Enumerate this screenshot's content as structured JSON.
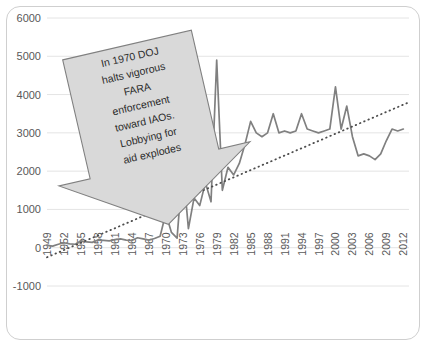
{
  "chart_data": {
    "type": "line",
    "title": "",
    "xlabel": "",
    "ylabel": "",
    "ylim": [
      -1000,
      6000
    ],
    "ytick_values": [
      -1000,
      0,
      1000,
      2000,
      3000,
      4000,
      5000,
      6000
    ],
    "ytick_labels": [
      "-1000",
      "0",
      "1000",
      "2000",
      "3000",
      "4000",
      "5000",
      "6000"
    ],
    "xtick_labels": [
      "1949",
      "1952",
      "1955",
      "1958",
      "1961",
      "1964",
      "1967",
      "1970",
      "1973",
      "1976",
      "1979",
      "1982",
      "1985",
      "1988",
      "1991",
      "1994",
      "1997",
      "2000",
      "2003",
      "2006",
      "2009",
      "2012"
    ],
    "xlim": [
      1949,
      2013
    ],
    "grid": "horizontal",
    "legend": "none",
    "series": [
      {
        "name": "FARA registrations",
        "style": "solid",
        "color": "#808080",
        "x": [
          1949,
          1950,
          1951,
          1952,
          1953,
          1954,
          1955,
          1956,
          1957,
          1958,
          1959,
          1960,
          1961,
          1962,
          1963,
          1964,
          1965,
          1966,
          1967,
          1968,
          1969,
          1970,
          1971,
          1972,
          1973,
          1974,
          1975,
          1976,
          1977,
          1978,
          1979,
          1980,
          1981,
          1982,
          1983,
          1984,
          1985,
          1986,
          1987,
          1988,
          1989,
          1990,
          1991,
          1992,
          1993,
          1994,
          1995,
          1996,
          1997,
          1998,
          1999,
          2000,
          2001,
          2002,
          2003,
          2004,
          2005,
          2006,
          2007,
          2008,
          2009,
          2010,
          2011,
          2012
        ],
        "values": [
          60,
          40,
          90,
          130,
          100,
          90,
          180,
          150,
          140,
          200,
          190,
          180,
          210,
          230,
          200,
          190,
          260,
          230,
          200,
          240,
          300,
          900,
          400,
          250,
          2150,
          500,
          1300,
          1100,
          1700,
          1200,
          4900,
          1500,
          2100,
          1900,
          2200,
          2700,
          3300,
          3000,
          2900,
          3000,
          3500,
          3000,
          3050,
          3000,
          3050,
          3500,
          3100,
          3050,
          3000,
          3050,
          3100,
          4200,
          3100,
          3700,
          2900,
          2400,
          2450,
          2400,
          2300,
          2450,
          2800,
          3100,
          3050,
          3100
        ]
      },
      {
        "name": "Linear trend",
        "style": "dotted",
        "color": "#4d4d4d",
        "x": [
          1949,
          2013
        ],
        "values": [
          -250,
          3800
        ]
      }
    ],
    "annotations": [
      {
        "name": "doj-fara-callout",
        "shape": "down-arrow-callout",
        "rotation_deg": -13,
        "fill": "#d9d9d9",
        "stroke": "#808080",
        "points_to_year": 1973,
        "lines": [
          "In 1970 DOJ",
          "halts vigorous",
          "FARA",
          "enforcement",
          "toward IAOs.",
          "Lobbying for",
          "aid explodes"
        ]
      }
    ]
  },
  "style": {
    "frame_color": "#cfcfcf",
    "grid_color": "#e4e4e4",
    "tick_text_color": "#595959",
    "series_color": "#808080",
    "series_dark_color": "#3f3f3f",
    "trend_color": "#4d4d4d",
    "callout_fill": "#d9d9d9",
    "callout_stroke": "#7f7f7f",
    "background": "#ffffff"
  }
}
